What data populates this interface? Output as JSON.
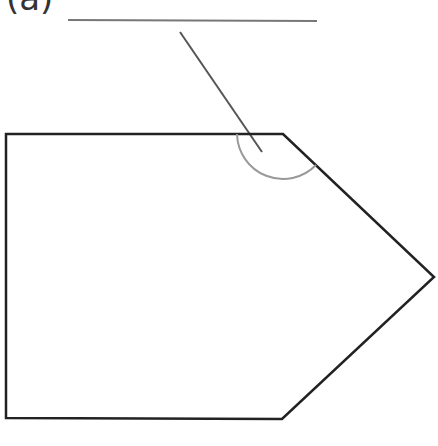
{
  "question": {
    "label": "(a)",
    "answer_blank": ""
  },
  "diagram": {
    "shape": "pentagon",
    "vertices": [
      [
        6,
        134
      ],
      [
        283,
        134
      ],
      [
        434,
        277
      ],
      [
        282,
        419
      ],
      [
        6,
        418
      ]
    ],
    "marked_angle_vertex": [
      283,
      134
    ],
    "colors": {
      "outline": "#222222",
      "arc": "#999999",
      "pointer": "#555555",
      "blank_line": "#777777"
    }
  }
}
